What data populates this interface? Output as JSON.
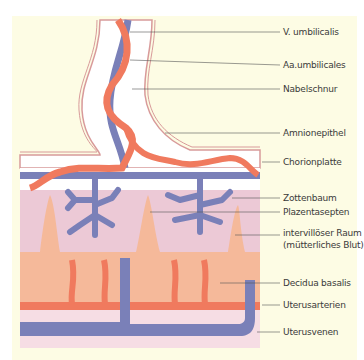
{
  "diagram": {
    "labels": [
      {
        "id": "v-umbilicalis",
        "text": "V. umbilicalis",
        "y": 32
      },
      {
        "id": "aa-umbilicales",
        "text": "Aa.umbilicales",
        "y": 65
      },
      {
        "id": "nabelschnur",
        "text": "Nabelschnur",
        "y": 89
      },
      {
        "id": "amnionepithel",
        "text": "Amnionepithel",
        "y": 133
      },
      {
        "id": "chorionplatte",
        "text": "Chorionplatte",
        "y": 162
      },
      {
        "id": "zottenbaum",
        "text": "Zottenbaum",
        "y": 198
      },
      {
        "id": "plazentasepten",
        "text": "Plazentasepten",
        "y": 212
      },
      {
        "id": "intervilloeser-raum",
        "text": "intervillöser Raum",
        "y": 233
      },
      {
        "id": "intervilloeser-raum-sub",
        "text": "(mütterliches Blut)",
        "y": 245
      },
      {
        "id": "decidua-basalis",
        "text": "Decidua basalis",
        "y": 283
      },
      {
        "id": "uterusarterien",
        "text": "Uterusarterien",
        "y": 305
      },
      {
        "id": "uterusvenen",
        "text": "Uterusvenen",
        "y": 332
      }
    ],
    "colors": {
      "background": "#fdfce4",
      "artery": "#f07a5e",
      "vein": "#7a80b8",
      "intervillous": "#ecc9d6",
      "decidua": "#f5b99a",
      "chorion": "#ffffff",
      "uterus_wall": "#f6dde4",
      "amnion_line": "#d89a9a"
    }
  }
}
